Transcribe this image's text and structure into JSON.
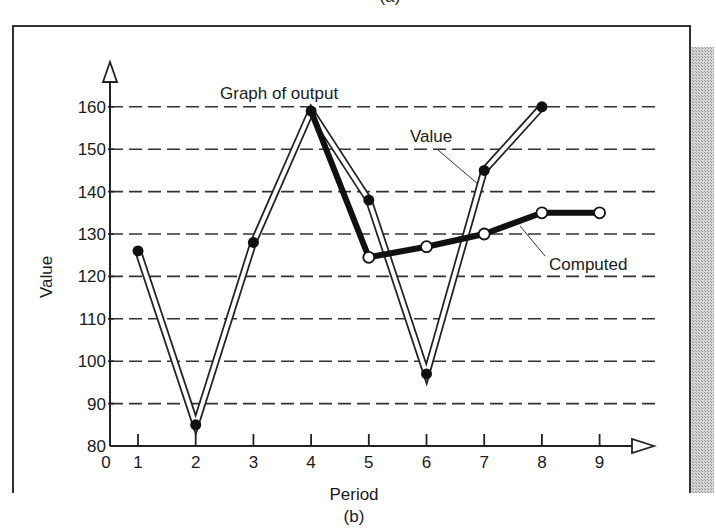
{
  "figure": {
    "top_caption": "(a)",
    "caption": "(b)",
    "frame_color": "#333333",
    "shade_color": "#bdbdbd"
  },
  "chart_data": {
    "type": "line",
    "title": "Graph of output",
    "xlabel": "Period",
    "ylabel": "Value",
    "origin_label": "0",
    "x": [
      1,
      2,
      3,
      4,
      5,
      6,
      7,
      8,
      9
    ],
    "x_ticks": [
      "1",
      "2",
      "3",
      "4",
      "5",
      "6",
      "7",
      "8",
      "9"
    ],
    "y_ticks": [
      "80",
      "90",
      "100",
      "110",
      "120",
      "130",
      "140",
      "150",
      "160"
    ],
    "ylim": [
      80,
      165
    ],
    "xlim": [
      0,
      10
    ],
    "grid": "horizontal dashed",
    "series": [
      {
        "name": "Value",
        "style": "double line, filled markers",
        "x": [
          1,
          2,
          3,
          4,
          5,
          6,
          7,
          8
        ],
        "values": [
          126,
          85,
          128,
          159,
          138,
          97,
          145,
          160
        ]
      },
      {
        "name": "Computed",
        "style": "thick solid line, open markers",
        "x": [
          4,
          5,
          6,
          7,
          8,
          9
        ],
        "values": [
          159,
          124.5,
          127,
          130,
          135,
          135
        ]
      }
    ],
    "annotations": [
      {
        "text": "Graph of output",
        "target": "peak at period 4"
      },
      {
        "text": "Value",
        "target": "Value series near period 7"
      },
      {
        "text": "Computed",
        "target": "Computed series near period 7.5"
      }
    ]
  }
}
